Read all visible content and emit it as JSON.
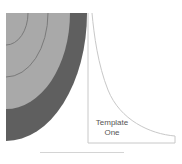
{
  "diagram": {
    "template_label_line1": "Template",
    "template_label_line2": "One",
    "colors": {
      "outer_band": "#5f5f5f",
      "middle_band": "#a9a9a9",
      "inner_band": "#a5a5a5",
      "arc_lines": "#7a7a7a",
      "template_border": "#c8c8c8",
      "background": "#ffffff"
    }
  }
}
